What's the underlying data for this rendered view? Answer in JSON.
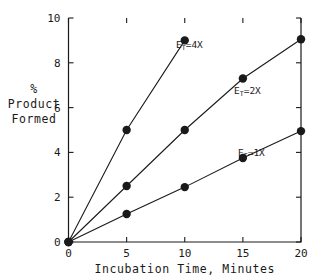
{
  "chart_data": {
    "type": "line",
    "title": "",
    "xlabel": "Incubation Time, Minutes",
    "ylabel": "% Product Formed",
    "ylabel_lines": [
      "%",
      "Product",
      "Formed"
    ],
    "xlim": [
      0,
      20
    ],
    "ylim": [
      0,
      10
    ],
    "xticks": [
      0,
      5,
      10,
      15,
      20
    ],
    "yticks": [
      0,
      2,
      4,
      6,
      8,
      10
    ],
    "xtick_labels": [
      "0",
      "5",
      "10",
      "15",
      "20"
    ],
    "ytick_labels": [
      "0",
      "2",
      "4",
      "6",
      "8",
      "10"
    ],
    "grid": false,
    "legend_position": "inline-annotations",
    "marker": "filled-circle",
    "line_color": "#1a1a1a",
    "marker_color": "#1a1a1a",
    "background_color": "#ffffff",
    "series": [
      {
        "name": "E_T=4X",
        "label_base": "E",
        "label_sub": "T",
        "label_rest": "=4X",
        "x": [
          0,
          5,
          10
        ],
        "values": [
          0,
          5.0,
          9.0
        ]
      },
      {
        "name": "E_T=2X",
        "label_base": "E",
        "label_sub": "T",
        "label_rest": "=2X",
        "x": [
          0,
          5,
          10,
          15,
          20
        ],
        "values": [
          0,
          2.5,
          5.0,
          7.3,
          9.05
        ]
      },
      {
        "name": "E_T=1X",
        "label_base": "E",
        "label_sub": "T",
        "label_rest": "=1X",
        "x": [
          0,
          5,
          10,
          15,
          20
        ],
        "values": [
          0,
          1.25,
          2.45,
          3.75,
          4.95
        ]
      }
    ],
    "annotations": [
      {
        "text": "E_T=4X",
        "series_index": 0,
        "x_px": 176,
        "y_px": 48
      },
      {
        "text": "E_T=2X",
        "series_index": 1,
        "x_px": 234,
        "y_px": 94
      },
      {
        "text": "E_T=1X",
        "series_index": 2,
        "x_px": 238,
        "y_px": 156
      }
    ]
  }
}
